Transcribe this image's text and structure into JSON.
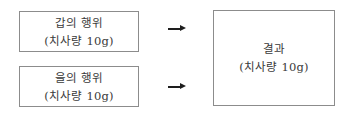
{
  "diagram": {
    "nodes": [
      {
        "id": "gap",
        "title": "갑의 행위",
        "subtitle": "(치사량 10g)"
      },
      {
        "id": "eul",
        "title": "을의 행위",
        "subtitle": "(치사량 10g)"
      },
      {
        "id": "result",
        "title": "결과",
        "subtitle": "(치사량 10g)"
      }
    ],
    "edges": [
      {
        "from": "gap",
        "to": "result",
        "icon": "right-arrow-icon"
      },
      {
        "from": "eul",
        "to": "result",
        "icon": "right-arrow-icon"
      }
    ],
    "colors": {
      "border": "#8c8c8c",
      "text": "#3a3a3a",
      "arrow": "#1e1e1e"
    }
  }
}
